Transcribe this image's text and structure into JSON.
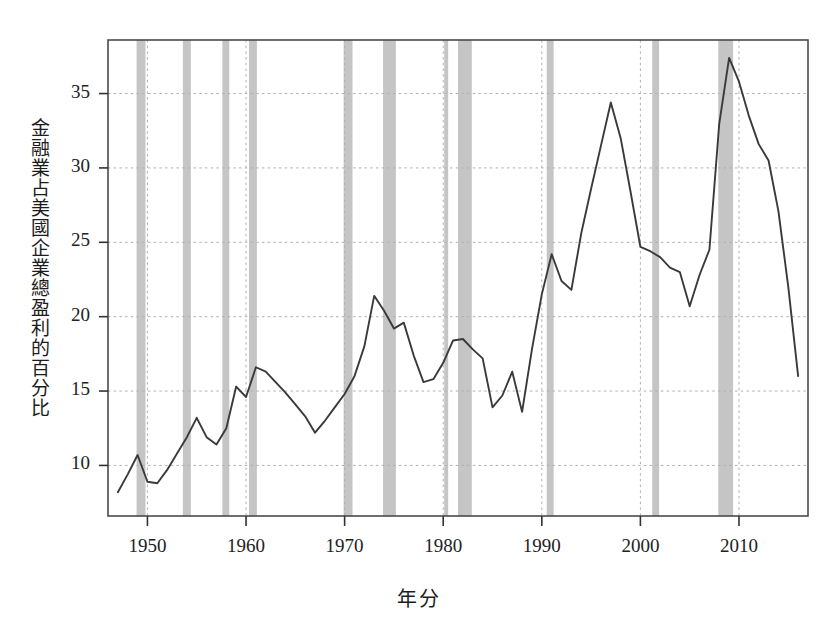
{
  "chart_data": {
    "type": "line",
    "title": "",
    "xlabel": "年分",
    "ylabel": "金融業占美國企業總盈利的百分比",
    "xlim": [
      1946.0,
      1917.0
    ],
    "xlim_real": [
      1946.0,
      2017.0
    ],
    "ylim": [
      6.6,
      38.6
    ],
    "grid": true,
    "legend": null,
    "y_ticks": [
      10,
      15,
      20,
      25,
      30,
      35
    ],
    "y_tick_labels": [
      "10",
      "15",
      "20",
      "25",
      "30",
      "35"
    ],
    "x_ticks": [
      1950,
      1960,
      1970,
      1980,
      1990,
      2000,
      2010
    ],
    "x_tick_labels": [
      "1950",
      "1960",
      "1970",
      "1980",
      "1990",
      "2000",
      "2010"
    ],
    "line_color": "#3a3a3a",
    "band_color": "#b8b8b8",
    "frame_color": "#4a4a4a",
    "gridline_color": "#b0b0b0",
    "series": [
      {
        "name": "金融業占美國企業總盈利的百分比",
        "x": [
          1947,
          1948,
          1949,
          1950,
          1951,
          1952,
          1953,
          1954,
          1955,
          1956,
          1957,
          1958,
          1959,
          1960,
          1961,
          1962,
          1963,
          1964,
          1965,
          1966,
          1967,
          1968,
          1969,
          1970,
          1971,
          1972,
          1973,
          1974,
          1975,
          1976,
          1977,
          1978,
          1979,
          1980,
          1981,
          1982,
          1983,
          1984,
          1985,
          1986,
          1987,
          1988,
          1989,
          1990,
          1991,
          1992,
          1993,
          1994,
          1995,
          1996,
          1997,
          1998,
          1999,
          2000,
          2001,
          2002,
          2003,
          2004,
          2005,
          2006,
          2007,
          2008,
          2009,
          2010,
          2011,
          2012,
          2013,
          2014,
          2015,
          2016
        ],
        "values": [
          8.2,
          9.4,
          10.7,
          8.9,
          8.8,
          9.7,
          10.8,
          11.9,
          13.2,
          11.9,
          11.4,
          12.5,
          15.3,
          14.6,
          16.6,
          16.3,
          15.6,
          14.9,
          14.1,
          13.3,
          12.2,
          13.0,
          13.9,
          14.8,
          16.0,
          18.0,
          21.4,
          20.4,
          19.2,
          19.6,
          17.4,
          15.6,
          15.8,
          16.9,
          18.4,
          18.5,
          17.8,
          17.2,
          13.9,
          14.7,
          16.3,
          13.6,
          17.8,
          21.5,
          24.2,
          22.4,
          21.8,
          25.6,
          28.6,
          31.5,
          34.4,
          32.0,
          28.4,
          24.7,
          24.4,
          24.0,
          23.3,
          23.0,
          20.7,
          22.8,
          24.5,
          33.0,
          37.4,
          35.8,
          33.5,
          31.6,
          30.5,
          27.1,
          22.0,
          16.0
        ],
        "values_note": "Post-2007 segment plunges to 7.5 in 2008 then rebounds"
      }
    ],
    "recession_bands": [
      {
        "start": 1948.9,
        "end": 1949.8
      },
      {
        "start": 1953.6,
        "end": 1954.4
      },
      {
        "start": 1957.6,
        "end": 1958.3
      },
      {
        "start": 1960.3,
        "end": 1961.1
      },
      {
        "start": 1969.9,
        "end": 1970.8
      },
      {
        "start": 1973.9,
        "end": 1975.2
      },
      {
        "start": 1980.1,
        "end": 1980.5
      },
      {
        "start": 1981.5,
        "end": 1982.9
      },
      {
        "start": 1990.5,
        "end": 1991.2
      },
      {
        "start": 2001.2,
        "end": 2001.9
      },
      {
        "start": 2007.9,
        "end": 2009.4
      }
    ]
  },
  "accessibility": {
    "figure_role": "line chart with recession shading"
  }
}
